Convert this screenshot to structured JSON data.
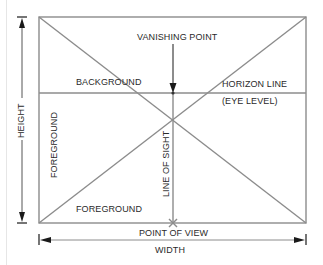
{
  "diagram": {
    "type": "one-point perspective picture-plane diagram",
    "labels": {
      "vanishing_point": "VANISHING POINT",
      "background": "BACKGROUND",
      "horizon_line": "HORIZON LINE",
      "eye_level": "(EYE LEVEL)",
      "foreground_left": "FOREGROUND",
      "foreground_bottom": "FOREGROUND",
      "line_of_sight": "LINE OF SIGHT",
      "point_of_view": "POINT OF VIEW",
      "width": "WIDTH",
      "height": "HEIGHT"
    },
    "colors": {
      "line": "#8a8a8a",
      "text": "#2a2a2a",
      "arrow": "#1a1a1a"
    },
    "geometry": {
      "frame": {
        "x1": 39,
        "y1": 17,
        "x2": 306,
        "y2": 223
      },
      "vanishing_point": {
        "x": 173,
        "y": 93
      },
      "point_of_view": {
        "x": 173,
        "y": 223
      }
    }
  }
}
